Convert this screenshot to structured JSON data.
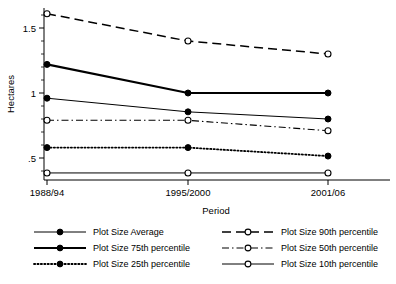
{
  "chart_data": {
    "type": "line",
    "title": "",
    "xlabel": "Period",
    "ylabel": "Hectares",
    "categories": [
      "1988/94",
      "1995/2000",
      "2001/06"
    ],
    "ylim": [
      0.3,
      1.68
    ],
    "yticks": [
      0.5,
      1,
      1.5
    ],
    "ytick_labels": [
      ".5",
      "1",
      "1.5"
    ],
    "grid": false,
    "legend_position": "bottom",
    "series": [
      {
        "name": "Plot Size Average",
        "values": [
          0.96,
          0.855,
          0.8
        ],
        "line_style": "solid-thin",
        "marker": "filled-circle"
      },
      {
        "name": "Plot Size 75th percentile",
        "values": [
          1.22,
          1.0,
          1.0
        ],
        "line_style": "solid-thick",
        "marker": "filled-circle"
      },
      {
        "name": "Plot Size 25th percentile",
        "values": [
          0.58,
          0.58,
          0.515
        ],
        "line_style": "dotted",
        "marker": "filled-circle"
      },
      {
        "name": "Plot Size 90th percentile",
        "values": [
          1.61,
          1.4,
          1.3
        ],
        "line_style": "dashed",
        "marker": "open-circle"
      },
      {
        "name": "Plot Size 50th percentile",
        "values": [
          0.79,
          0.79,
          0.71
        ],
        "line_style": "dash-dot",
        "marker": "open-circle"
      },
      {
        "name": "Plot Size 10th percentile",
        "values": [
          0.385,
          0.385,
          0.385
        ],
        "line_style": "solid-thin",
        "marker": "open-circle"
      }
    ]
  },
  "colors": {
    "foreground": "#000000",
    "background": "#ffffff",
    "axis": "#000000"
  }
}
